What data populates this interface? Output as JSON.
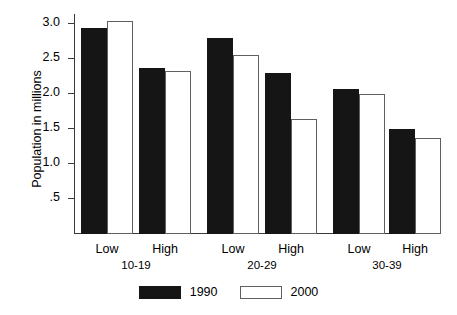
{
  "chart_data": {
    "type": "bar",
    "title": "",
    "xlabel": "",
    "ylabel": "Population in millions",
    "ylim": [
      0,
      3.15
    ],
    "grid": false,
    "legend_position": "bottom-center",
    "ytick_labels": [
      "3.0",
      "2.5",
      "2.0",
      "1.5",
      "1.0",
      ".5"
    ],
    "ytick_values": [
      3.0,
      2.5,
      2.0,
      1.5,
      1.0,
      0.5
    ],
    "group_labels": [
      "10-19",
      "20-29",
      "30-39"
    ],
    "categories": [
      "Low",
      "High",
      "Low",
      "High",
      "Low",
      "High"
    ],
    "series": [
      {
        "name": "1990",
        "color": "#151515",
        "values": [
          2.95,
          2.38,
          2.8,
          2.3,
          2.08,
          1.5
        ]
      },
      {
        "name": "2000",
        "color": "#ffffff",
        "values": [
          3.05,
          2.33,
          2.56,
          1.65,
          2.0,
          1.38
        ]
      }
    ]
  },
  "legend": {
    "entries": [
      {
        "label": "1990"
      },
      {
        "label": "2000"
      }
    ]
  }
}
